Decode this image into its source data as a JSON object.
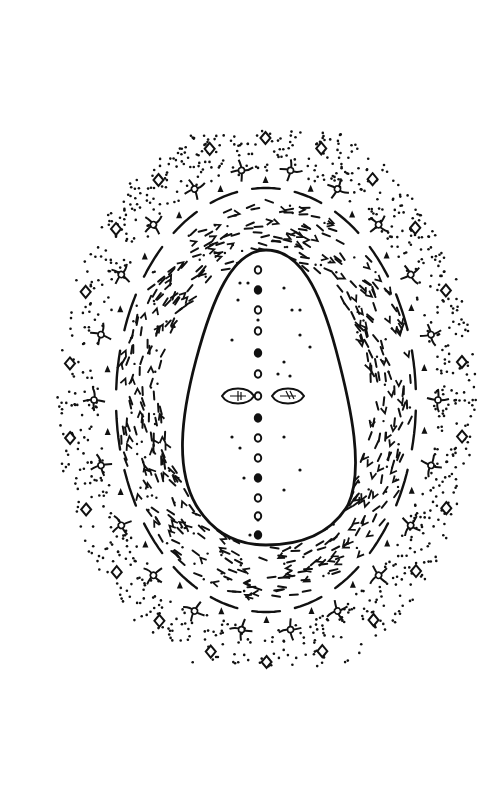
{
  "artwork": {
    "type": "ink line drawing",
    "subject": "oval mandala with a seed-like figure",
    "background": "#ffffff",
    "ink": "#111111",
    "center": [
      266,
      400
    ],
    "layers": [
      {
        "name": "outer-dot-halo",
        "motif": "stippled dots"
      },
      {
        "name": "outer-ring",
        "motif": "four-armed star crosses alternating with diamonds and small arrowheads"
      },
      {
        "name": "solid-oval-band",
        "motif": "broken dashed oval line"
      },
      {
        "name": "dash-field",
        "motif": "short dashes, chevrons and tilde marks"
      },
      {
        "name": "inner-seed",
        "motif": "egg-shaped solid outline"
      },
      {
        "name": "spine",
        "motif": "vertical line of small circles and dots"
      },
      {
        "name": "leaf-eyes",
        "motif": "two leaf-shaped eyes flanking the spine"
      }
    ]
  }
}
